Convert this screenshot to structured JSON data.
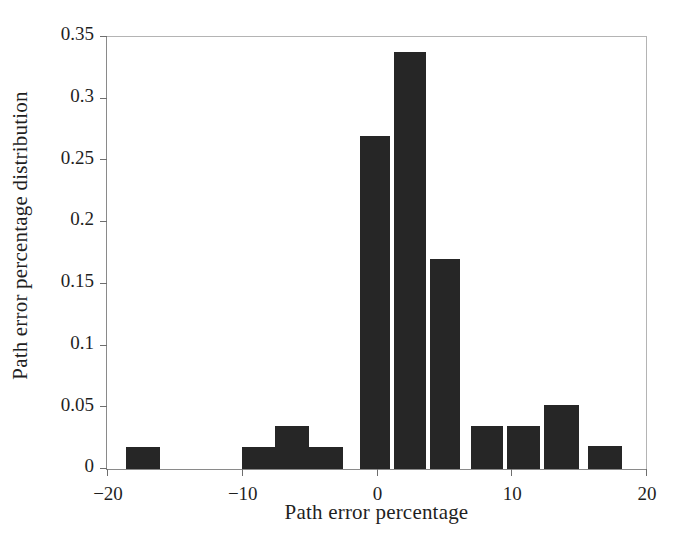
{
  "chart_data": {
    "type": "bar",
    "title": "",
    "xlabel": "Path error percentage",
    "ylabel": "Path error percentage distribution",
    "xlim": [
      -20,
      20
    ],
    "ylim": [
      0,
      0.35
    ],
    "grid": false,
    "legend": null,
    "bin_width": 2.5,
    "bar_color": "#262626",
    "xticks": [
      -20,
      -10,
      0,
      10,
      20
    ],
    "xtick_labels": [
      "−20",
      "−10",
      "0",
      "10",
      "20"
    ],
    "yticks": [
      0,
      0.05,
      0.1,
      0.15,
      0.2,
      0.25,
      0.3,
      0.35
    ],
    "ytick_labels": [
      "0",
      "0.05",
      "0.1",
      "0.15",
      "0.2",
      "0.25",
      "0.3",
      "0.35"
    ],
    "bins": [
      {
        "left": -18.6,
        "right": -16.1,
        "value": 0.018
      },
      {
        "left": -10.0,
        "right": -7.5,
        "value": 0.018
      },
      {
        "left": -7.5,
        "right": -5.0,
        "value": 0.035
      },
      {
        "left": -5.0,
        "right": -2.5,
        "value": 0.018
      },
      {
        "left": -1.2,
        "right": 1.0,
        "value": 0.27
      },
      {
        "left": 1.3,
        "right": 3.7,
        "value": 0.338
      },
      {
        "left": 4.0,
        "right": 6.2,
        "value": 0.17
      },
      {
        "left": 7.0,
        "right": 9.4,
        "value": 0.035
      },
      {
        "left": 9.7,
        "right": 12.1,
        "value": 0.035
      },
      {
        "left": 12.4,
        "right": 15.0,
        "value": 0.052
      },
      {
        "left": 15.7,
        "right": 18.2,
        "value": 0.019
      }
    ],
    "categories": [
      -17.35,
      -8.75,
      -6.25,
      -3.75,
      -0.1,
      2.5,
      5.1,
      8.2,
      10.9,
      13.7,
      16.95
    ],
    "values": [
      0.018,
      0.018,
      0.035,
      0.018,
      0.27,
      0.338,
      0.17,
      0.035,
      0.035,
      0.052,
      0.019
    ]
  }
}
